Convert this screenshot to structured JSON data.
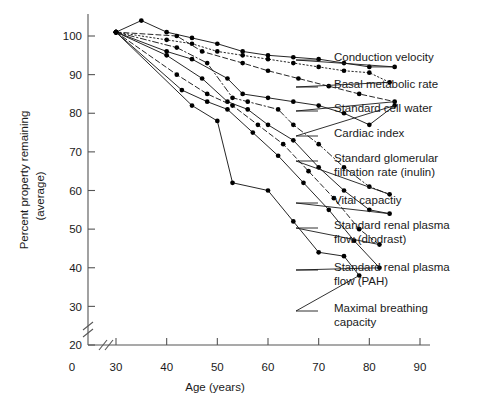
{
  "chart_data": {
    "type": "line",
    "title": "",
    "subtitle": "",
    "xlabel": "Age (years)",
    "ylabel": "Percent property remaining (average)",
    "ylabel_line1": "Percent property remaining",
    "ylabel_line2": "(average)",
    "xlim": [
      28,
      92
    ],
    "ylim": [
      15,
      104
    ],
    "xticks": [
      30,
      40,
      50,
      60,
      70,
      80,
      90
    ],
    "yticks": [
      20,
      30,
      40,
      50,
      60,
      70,
      80,
      90,
      100
    ],
    "xtick_labels": [
      "30",
      "40",
      "50",
      "60",
      "70",
      "80",
      "90"
    ],
    "ytick_labels": [
      "20",
      "30",
      "40",
      "50",
      "60",
      "70",
      "80",
      "90",
      "100"
    ],
    "origin_label": "0",
    "axis_break_x": true,
    "axis_break_y": true,
    "grid": false,
    "legend_position": "right-callouts",
    "marker": "filled-circle",
    "series": [
      {
        "name": "Conduction velocity",
        "label": "Conduction velocity",
        "linestyle": "solid",
        "points": [
          [
            30,
            101
          ],
          [
            35,
            104
          ],
          [
            40,
            101
          ],
          [
            45,
            99.5
          ],
          [
            50,
            98
          ],
          [
            55,
            96
          ],
          [
            60,
            95
          ],
          [
            65,
            94.5
          ],
          [
            70,
            94
          ],
          [
            75,
            93
          ],
          [
            80,
            92
          ],
          [
            85,
            92
          ]
        ]
      },
      {
        "name": "Basal metabolic rate",
        "label": "Basal metabolic rate",
        "linestyle": "dotted",
        "points": [
          [
            30,
            101
          ],
          [
            40,
            99
          ],
          [
            45,
            98
          ],
          [
            50,
            96
          ],
          [
            55,
            95
          ],
          [
            60,
            94
          ],
          [
            65,
            93
          ],
          [
            70,
            92
          ],
          [
            75,
            91
          ],
          [
            80,
            90.5
          ],
          [
            84,
            88
          ]
        ]
      },
      {
        "name": "Standard cell water",
        "label": "Standard cell water",
        "linestyle": "dashed",
        "points": [
          [
            30,
            101
          ],
          [
            42,
            100
          ],
          [
            47,
            96
          ],
          [
            55,
            93
          ],
          [
            60,
            91
          ],
          [
            66,
            89
          ],
          [
            72,
            87
          ],
          [
            78,
            85
          ],
          [
            85,
            83
          ]
        ]
      },
      {
        "name": "Cardiac index",
        "label": "Cardiac index",
        "linestyle": "solid",
        "points": [
          [
            30,
            101
          ],
          [
            40,
            96
          ],
          [
            45,
            94
          ],
          [
            52,
            89
          ],
          [
            55,
            85
          ],
          [
            60,
            84
          ],
          [
            65,
            83
          ],
          [
            70,
            82
          ],
          [
            75,
            80
          ],
          [
            80,
            77
          ],
          [
            85,
            82
          ]
        ]
      },
      {
        "name": "Standard glomerular filtration rate (inulin)",
        "label": "Standard glomerular filtration rate (inulin)",
        "label_line1": "Standard glomerular",
        "label_line2": "filtration rate (inulin)",
        "linestyle": "dashdot",
        "points": [
          [
            30,
            101
          ],
          [
            42,
            97
          ],
          [
            48,
            93
          ],
          [
            53,
            84
          ],
          [
            56,
            83
          ],
          [
            62,
            81
          ],
          [
            65,
            77
          ],
          [
            70,
            72
          ],
          [
            75,
            66
          ],
          [
            80,
            61
          ],
          [
            84,
            59
          ]
        ]
      },
      {
        "name": "Vital capactiy",
        "label": "Vital capactiy",
        "linestyle": "solid",
        "points": [
          [
            30,
            101
          ],
          [
            40,
            95
          ],
          [
            47,
            89
          ],
          [
            52,
            83
          ],
          [
            56,
            81
          ],
          [
            60,
            77
          ],
          [
            65,
            73
          ],
          [
            70,
            66
          ],
          [
            75,
            60
          ],
          [
            80,
            55
          ],
          [
            84,
            54
          ]
        ]
      },
      {
        "name": "Standard renal plasma flow (diodrast)",
        "label": "Standard renal plasma flow (diodrast)",
        "label_line1": "Standard renal plasma",
        "label_line2": "flow (diodrast)",
        "linestyle": "dashed",
        "points": [
          [
            30,
            101
          ],
          [
            42,
            90
          ],
          [
            48,
            85
          ],
          [
            53,
            82
          ],
          [
            58,
            77
          ],
          [
            63,
            72
          ],
          [
            68,
            65
          ],
          [
            73,
            58
          ],
          [
            78,
            50
          ],
          [
            82,
            46
          ]
        ]
      },
      {
        "name": "Standard renal plasma flow (PAH)",
        "label": "Standard renal plasma flow (PAH)",
        "label_line1": "Standard renal plasma",
        "label_line2": "flow (PAH)",
        "linestyle": "solid",
        "points": [
          [
            30,
            101
          ],
          [
            43,
            86
          ],
          [
            48,
            83
          ],
          [
            52,
            81
          ],
          [
            57,
            75
          ],
          [
            62,
            69
          ],
          [
            67,
            62
          ],
          [
            72,
            55
          ],
          [
            77,
            47
          ],
          [
            82,
            40
          ]
        ]
      },
      {
        "name": "Maximal breathing capacity",
        "label": "Maximal breathing capacity",
        "label_line1": "Maximal breathing",
        "label_line2": "capacity",
        "linestyle": "solid",
        "points": [
          [
            30,
            101
          ],
          [
            45,
            82
          ],
          [
            50,
            78
          ],
          [
            53,
            62
          ],
          [
            60,
            60
          ],
          [
            65,
            52
          ],
          [
            70,
            44
          ],
          [
            75,
            43
          ],
          [
            78,
            38
          ]
        ]
      }
    ],
    "callouts": [
      {
        "label": "Conduction velocity",
        "lines": [
          "Conduction velocity"
        ]
      },
      {
        "label": "Basal metabolic rate",
        "lines": [
          "Basal metabolic rate"
        ]
      },
      {
        "label": "Standard cell water",
        "lines": [
          "Standard cell water"
        ]
      },
      {
        "label": "Cardiac index",
        "lines": [
          "Cardiac index"
        ]
      },
      {
        "label": "Standard glomerular filtration rate (inulin)",
        "lines": [
          "Standard glomerular",
          "filtration rate (inulin)"
        ]
      },
      {
        "label": "Vital capactiy",
        "lines": [
          "Vital capactiy"
        ]
      },
      {
        "label": "Standard renal plasma flow (diodrast)",
        "lines": [
          "Standard renal plasma",
          "flow (diodrast)"
        ]
      },
      {
        "label": "Standard renal plasma flow (PAH)",
        "lines": [
          "Standard renal plasma",
          "flow (PAH)"
        ]
      },
      {
        "label": "Maximal breathing capacity",
        "lines": [
          "Maximal breathing",
          "capacity"
        ]
      }
    ],
    "colors": {
      "line": "#1a1a1a",
      "marker": "#000000",
      "axis": "#555555",
      "text": "#1a1a1a",
      "background": "#ffffff"
    }
  }
}
